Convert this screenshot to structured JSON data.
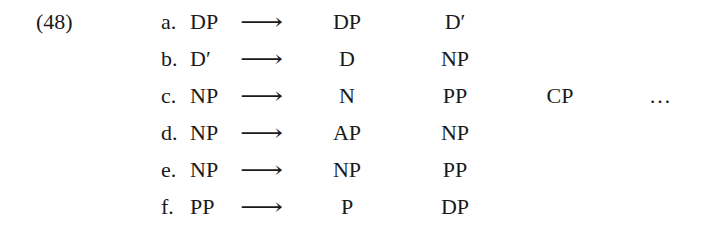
{
  "example": {
    "number": "(48)",
    "arrow": "⟶",
    "rules": [
      {
        "label": "a.",
        "lhs": "DP",
        "rhs": [
          "DP",
          "D′",
          "",
          ""
        ]
      },
      {
        "label": "b.",
        "lhs": "D′",
        "rhs": [
          "D",
          "NP",
          "",
          ""
        ]
      },
      {
        "label": "c.",
        "lhs": "NP",
        "rhs": [
          "N",
          "PP",
          "CP",
          "…"
        ]
      },
      {
        "label": "d.",
        "lhs": "NP",
        "rhs": [
          "AP",
          "NP",
          "",
          ""
        ]
      },
      {
        "label": "e.",
        "lhs": "NP",
        "rhs": [
          "NP",
          "PP",
          "",
          ""
        ]
      },
      {
        "label": "f.",
        "lhs": "PP",
        "rhs": [
          "P",
          "DP",
          "",
          ""
        ]
      }
    ]
  }
}
